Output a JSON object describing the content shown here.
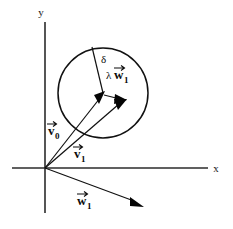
{
  "figure": {
    "background_color": "#ffffff",
    "ink_color": "#111111"
  },
  "axes": {
    "x_label": "x",
    "y_label": "y",
    "origin": {
      "x": 45,
      "y": 168
    },
    "x_axis": {
      "x1": 12,
      "y1": 168,
      "x2": 208,
      "y2": 168
    },
    "y_axis": {
      "x1": 45,
      "y1": 22,
      "x2": 45,
      "y2": 213
    }
  },
  "circle": {
    "name": "uncertainty-circle",
    "center_x": 103,
    "center_y": 93,
    "radius": 45,
    "color": "#111111"
  },
  "labels": {
    "delta": "δ",
    "lambda": "λ",
    "w": "w",
    "v": "v",
    "sub_zero": "0",
    "sub_one": "1"
  },
  "vectors": [
    {
      "name": "v0",
      "label_base": "v",
      "label_sub": "0",
      "from_x": 45,
      "from_y": 168,
      "to_x": 104,
      "to_y": 93,
      "label_x": 48,
      "label_y": 133
    },
    {
      "name": "v1",
      "label_base": "v",
      "label_sub": "1",
      "from_x": 45,
      "from_y": 168,
      "to_x": 124,
      "to_y": 100,
      "label_x": 74,
      "label_y": 156
    },
    {
      "name": "lambda-w1",
      "label_base": "w",
      "label_sub": "1",
      "prefix": "λ",
      "from_x": 104,
      "from_y": 95,
      "to_x": 126,
      "to_y": 101,
      "label_x": 110,
      "label_y": 74
    },
    {
      "name": "w1",
      "label_base": "w",
      "label_sub": "1",
      "from_x": 45,
      "from_y": 168,
      "to_x": 143,
      "to_y": 206,
      "label_x": 78,
      "label_y": 203
    }
  ],
  "delta_segment": {
    "name": "delta-radius",
    "from_x": 103,
    "from_y": 93,
    "to_x": 92,
    "to_y": 47,
    "label_x": 101,
    "label_y": 62
  }
}
